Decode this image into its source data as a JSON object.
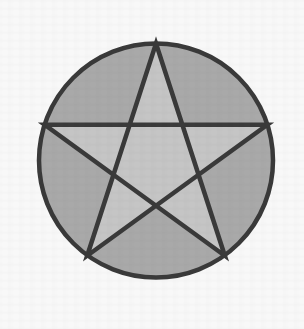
{
  "figure": {
    "canvas": {
      "width": 304,
      "height": 329
    },
    "colors": {
      "background": "#f8f8f8",
      "circle_fill": "#a9a9a9",
      "star_fill": "#c5c5c5",
      "stroke": "#3a3a3a"
    },
    "stroke_width": 4.5,
    "circle": {
      "center_x": 156,
      "center_y": 160.5,
      "radius": 117
    },
    "star": {
      "points": 5,
      "vertices": [
        {
          "name": "top",
          "x": 156,
          "y": 43.5
        },
        {
          "name": "upper-right",
          "x": 267.3,
          "y": 124.7
        },
        {
          "name": "lower-right",
          "x": 224.8,
          "y": 255.7
        },
        {
          "name": "lower-left",
          "x": 87.2,
          "y": 255.7
        },
        {
          "name": "upper-left",
          "x": 44.7,
          "y": 124.7
        }
      ],
      "outline_path": "M 156,43.5 L 224.8,255.7 L 44.7,124.7 L 267.3,124.7 L 87.2,255.7 Z"
    }
  }
}
